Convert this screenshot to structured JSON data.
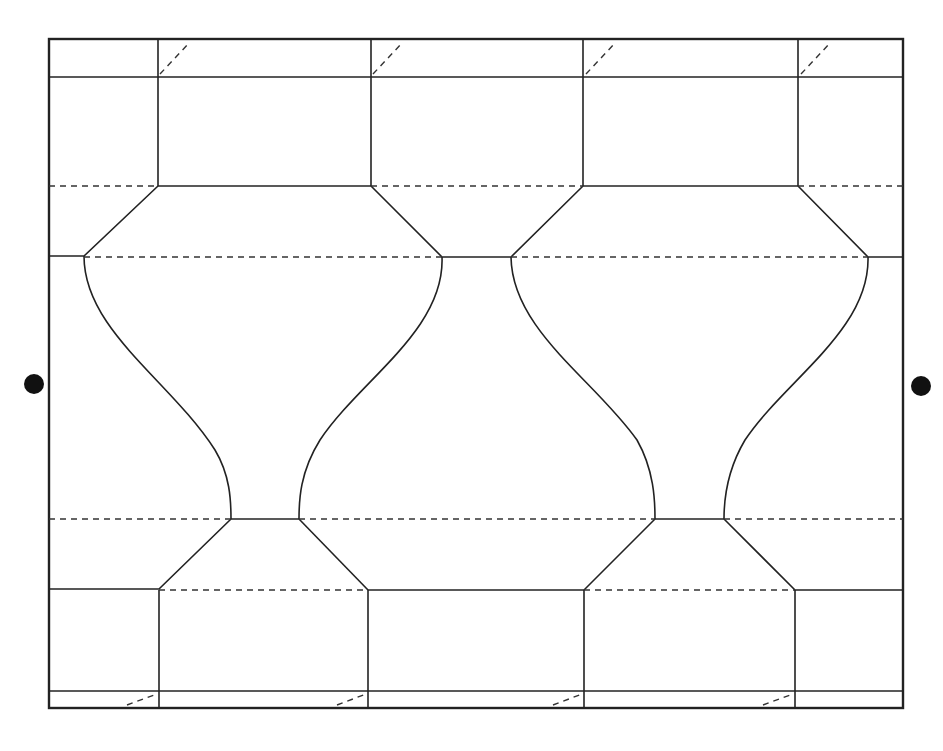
{
  "diagram": {
    "title": "",
    "colors": {
      "background": "#ffffff",
      "line": "#222222",
      "dot": "#111111"
    },
    "legend": {
      "solid": "cut line",
      "dashed": "fold line"
    },
    "markers": [
      {
        "name": "left-registration-dot",
        "x": 34,
        "y": 384
      },
      {
        "name": "right-registration-dot",
        "x": 921,
        "y": 386
      }
    ]
  }
}
